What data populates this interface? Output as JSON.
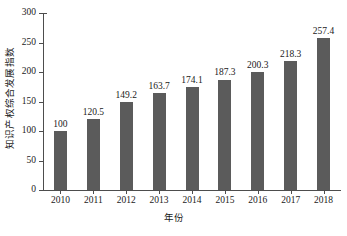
{
  "chart_data": {
    "type": "bar",
    "title": "",
    "subtitle": "",
    "xlabel": "年份",
    "ylabel": "知识产权综合发展指数",
    "categories": [
      "2010",
      "2011",
      "2012",
      "2013",
      "2014",
      "2015",
      "2016",
      "2017",
      "2018"
    ],
    "values": [
      100,
      120.5,
      149.2,
      163.7,
      174.1,
      187.3,
      200.3,
      218.3,
      257.4
    ],
    "value_labels": [
      "100",
      "120.5",
      "149.2",
      "163.7",
      "174.1",
      "187.3",
      "200.3",
      "218.3",
      "257.4"
    ],
    "ylim": [
      0,
      300
    ],
    "yticks": [
      0,
      50,
      100,
      150,
      200,
      250,
      300
    ],
    "ytick_labels": [
      "0",
      "50",
      "100",
      "150",
      "200",
      "250",
      "300"
    ],
    "grid": false,
    "legend": "none",
    "bar_color": "#5b5b5b",
    "axis_color": "#4d4d4d",
    "background_color": "#ffffff",
    "series": [
      {
        "name": "知识产权综合发展指数",
        "values": [
          100,
          120.5,
          149.2,
          163.7,
          174.1,
          187.3,
          200.3,
          218.3,
          257.4
        ]
      }
    ]
  }
}
